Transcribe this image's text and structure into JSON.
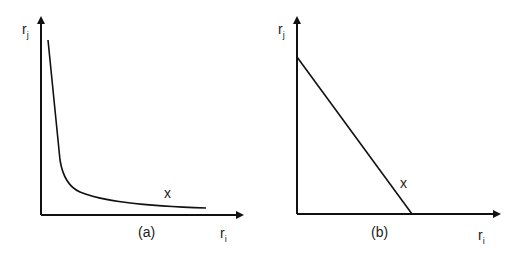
{
  "panels": [
    {
      "id": "a",
      "caption": "(a)",
      "y_axis_label": "r",
      "y_axis_sub": "j",
      "x_axis_label": "r",
      "x_axis_sub": "i",
      "point_label": "x",
      "curve": "hyperbolic convex decreasing"
    },
    {
      "id": "b",
      "caption": "(b)",
      "y_axis_label": "r",
      "y_axis_sub": "j",
      "x_axis_label": "r",
      "x_axis_sub": "i",
      "point_label": "x",
      "curve": "linear decreasing"
    }
  ],
  "colors": {
    "line": "#111111",
    "text": "#222222",
    "background": "#ffffff"
  }
}
